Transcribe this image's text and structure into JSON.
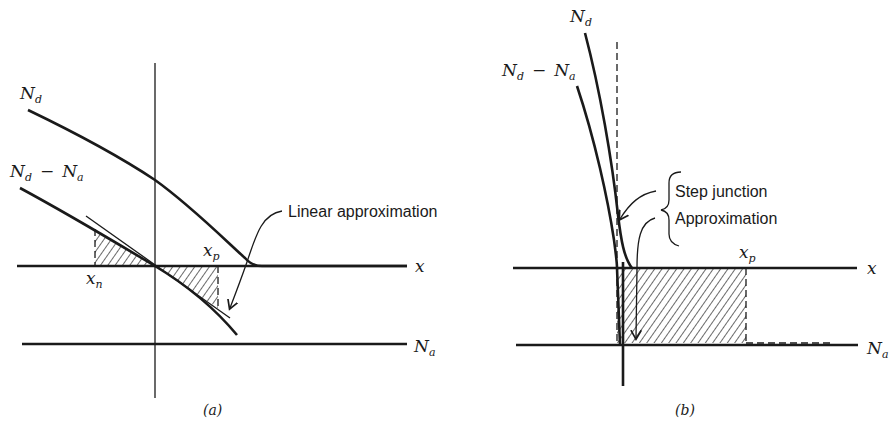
{
  "panel_a": {
    "caption": "(a)",
    "labels": {
      "nd_main": "N",
      "nd_sub": "d",
      "ndna_n1": "N",
      "ndna_s1": "d",
      "ndna_minus": "−",
      "ndna_n2": "N",
      "ndna_s2": "a",
      "xp_main": "x",
      "xp_sub": "p",
      "xn_main": "x",
      "xn_sub": "n",
      "x_axis": "x",
      "na_main": "N",
      "na_sub": "a"
    },
    "annotation": "Linear approximation"
  },
  "panel_b": {
    "caption": "(b)",
    "labels": {
      "nd_main": "N",
      "nd_sub": "d",
      "ndna_n1": "N",
      "ndna_s1": "d",
      "ndna_minus": "−",
      "ndna_n2": "N",
      "ndna_s2": "a",
      "xp_main": "x",
      "xp_sub": "p",
      "x_axis": "x",
      "na_main": "N",
      "na_sub": "a"
    },
    "annotation_line1": "Step junction",
    "annotation_line2": "Approximation"
  }
}
